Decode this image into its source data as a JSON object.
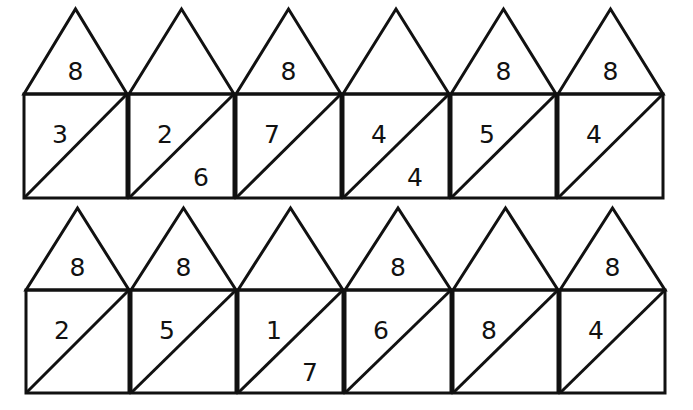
{
  "worksheet": {
    "title": "Number bond houses (make 8)",
    "rows": [
      {
        "houses": [
          {
            "roof": "8",
            "top_left": "3",
            "bottom_right": ""
          },
          {
            "roof": "",
            "top_left": "2",
            "bottom_right": "6"
          },
          {
            "roof": "8",
            "top_left": "7",
            "bottom_right": ""
          },
          {
            "roof": "",
            "top_left": "4",
            "bottom_right": "4"
          },
          {
            "roof": "8",
            "top_left": "5",
            "bottom_right": ""
          },
          {
            "roof": "8",
            "top_left": "4",
            "bottom_right": ""
          }
        ]
      },
      {
        "houses": [
          {
            "roof": "8",
            "top_left": "2",
            "bottom_right": ""
          },
          {
            "roof": "8",
            "top_left": "5",
            "bottom_right": ""
          },
          {
            "roof": "",
            "top_left": "1",
            "bottom_right": "7"
          },
          {
            "roof": "8",
            "top_left": "6",
            "bottom_right": ""
          },
          {
            "roof": "",
            "top_left": "8",
            "bottom_right": ""
          },
          {
            "roof": "8",
            "top_left": "4",
            "bottom_right": ""
          }
        ]
      }
    ]
  }
}
